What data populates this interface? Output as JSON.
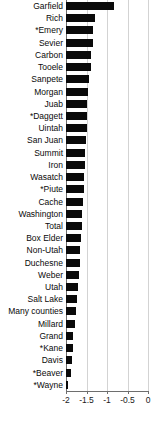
{
  "chart_data": {
    "type": "bar",
    "orientation": "horizontal",
    "title": "",
    "subtitle": "",
    "xlabel": "",
    "ylabel": "",
    "xlim": [
      -2.0,
      0.0
    ],
    "xticks": [
      -2,
      -1.5,
      -1,
      -0.5,
      0
    ],
    "xticklabels": [
      "-2",
      "-1.5",
      "-1",
      "-0.5",
      "0"
    ],
    "grid": true,
    "grid_axis": "x",
    "legend": false,
    "bar_color": "#0a0a0a",
    "gridline_color": "#d3d3d3",
    "axis_color": "#6e6e6e",
    "categories": [
      "Garfield",
      "Rich",
      "*Emery",
      "Sevier",
      "Carbon",
      "Tooele",
      "Sanpete",
      "Morgan",
      "Juab",
      "*Daggett",
      "Uintah",
      "San Juan",
      "Summit",
      "Iron",
      "Wasatch",
      "*Piute",
      "Cache",
      "Washington",
      "Total",
      "Box Elder",
      "Non-Utah",
      "Duchesne",
      "Weber",
      "Utah",
      "Salt Lake",
      "Many counties",
      "Millard",
      "Grand",
      "*Kane",
      "Davis",
      "*Beaver",
      "*Wayne"
    ],
    "values": [
      -0.83,
      -1.29,
      -1.33,
      -1.35,
      -1.38,
      -1.4,
      -1.44,
      -1.46,
      -1.48,
      -1.49,
      -1.5,
      -1.51,
      -1.53,
      -1.54,
      -1.56,
      -1.57,
      -1.59,
      -1.6,
      -1.62,
      -1.63,
      -1.65,
      -1.66,
      -1.68,
      -1.7,
      -1.72,
      -1.75,
      -1.78,
      -1.82,
      -1.84,
      -1.86,
      -1.89,
      -1.96
    ]
  }
}
